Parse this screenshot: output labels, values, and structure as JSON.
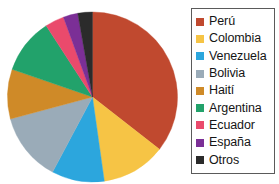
{
  "chart_data": {
    "type": "pie",
    "title": "",
    "legend_position": "right",
    "categories": [
      "Perú",
      "Colombia",
      "Venezuela",
      "Bolivia",
      "Haití",
      "Argentina",
      "Ecuador",
      "España",
      "Otros"
    ],
    "values": [
      35.6,
      12.2,
      10.0,
      13.1,
      9.4,
      10.6,
      3.6,
      2.8,
      2.7
    ],
    "units": "percent",
    "colors": [
      "#c0492f",
      "#f6c445",
      "#2ca6dd",
      "#9aabb8",
      "#cf8a28",
      "#22a26b",
      "#ea4a6c",
      "#7b2f96",
      "#2b2b2b"
    ],
    "slices": [
      {
        "label": "Perú",
        "value": 35.6,
        "color": "#c0492f",
        "start_angle": 0,
        "end_angle": 128
      },
      {
        "label": "Colombia",
        "value": 12.2,
        "color": "#f6c445",
        "start_angle": 128,
        "end_angle": 172
      },
      {
        "label": "Venezuela",
        "value": 10.0,
        "color": "#2ca6dd",
        "start_angle": 172,
        "end_angle": 208
      },
      {
        "label": "Bolivia",
        "value": 13.1,
        "color": "#9aabb8",
        "start_angle": 208,
        "end_angle": 255
      },
      {
        "label": "Haití",
        "value": 9.4,
        "color": "#cf8a28",
        "start_angle": 255,
        "end_angle": 289
      },
      {
        "label": "Argentina",
        "value": 10.6,
        "color": "#22a26b",
        "start_angle": 289,
        "end_angle": 327
      },
      {
        "label": "Ecuador",
        "value": 3.6,
        "color": "#ea4a6c",
        "start_angle": 327,
        "end_angle": 340
      },
      {
        "label": "España",
        "value": 2.8,
        "color": "#7b2f96",
        "start_angle": 340,
        "end_angle": 350
      },
      {
        "label": "Otros",
        "value": 2.7,
        "color": "#2b2b2b",
        "start_angle": 350,
        "end_angle": 360
      }
    ],
    "geometry": {
      "center_x": 92.5,
      "center_y": 97,
      "radius": 85
    }
  },
  "legend": {
    "border_color": "#5a5a5a",
    "items": [
      {
        "label": "Perú",
        "color": "#c0492f"
      },
      {
        "label": "Colombia",
        "color": "#f6c445"
      },
      {
        "label": "Venezuela",
        "color": "#2ca6dd"
      },
      {
        "label": "Bolivia",
        "color": "#9aabb8"
      },
      {
        "label": "Haití",
        "color": "#cf8a28"
      },
      {
        "label": "Argentina",
        "color": "#22a26b"
      },
      {
        "label": "Ecuador",
        "color": "#ea4a6c"
      },
      {
        "label": "España",
        "color": "#7b2f96"
      },
      {
        "label": "Otros",
        "color": "#2b2b2b"
      }
    ]
  }
}
